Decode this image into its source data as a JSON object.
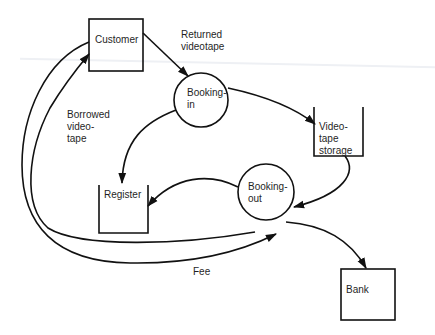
{
  "diagram": {
    "type": "data-flow-diagram",
    "entities": [
      {
        "id": "customer",
        "label": "Customer",
        "shape": "external-entity"
      },
      {
        "id": "bank",
        "label": "Bank",
        "shape": "external-entity"
      }
    ],
    "processes": [
      {
        "id": "booking_in",
        "label": "Booking-\nin",
        "shape": "circle"
      },
      {
        "id": "booking_out",
        "label": "Booking-\nout",
        "shape": "circle"
      }
    ],
    "stores": [
      {
        "id": "videotape_storage",
        "label": "Video-\ntape\nstorage",
        "shape": "open-box"
      },
      {
        "id": "register",
        "label": "Register",
        "shape": "open-box"
      }
    ],
    "flows": [
      {
        "from": "customer",
        "to": "booking_in",
        "label": "Returned\nvideotape"
      },
      {
        "from": "booking_in",
        "to": "videotape_storage",
        "label": ""
      },
      {
        "from": "booking_in",
        "to": "register",
        "label": ""
      },
      {
        "from": "videotape_storage",
        "to": "booking_out",
        "label": ""
      },
      {
        "from": "booking_out",
        "to": "register",
        "label": ""
      },
      {
        "from": "booking_out",
        "to": "customer",
        "label": "Borrowed\nvideo-\ntape"
      },
      {
        "from": "customer",
        "to": "booking_out",
        "label": "Fee"
      },
      {
        "from": "booking_out",
        "to": "bank",
        "label": ""
      }
    ]
  },
  "labels": {
    "customer": "Customer",
    "bank": "Bank",
    "booking_in": "Booking-\nin",
    "booking_out": "Booking-\nout",
    "videotape_storage": "Video-\ntape\nstorage",
    "register": "Register",
    "returned_videotape": "Returned\nvideotape",
    "borrowed_videotape": "Borrowed\nvideo-\ntape",
    "fee": "Fee"
  },
  "colors": {
    "stroke": "#111111",
    "background": "#ffffff"
  }
}
